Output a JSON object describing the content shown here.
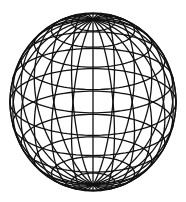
{
  "figure": {
    "type": "wireframe-sphere",
    "background": "#ffffff",
    "stroke_color": "#111111",
    "stroke_width": 1.3,
    "center": [
      93,
      102
    ],
    "radius_x": 83,
    "radius_y": 89,
    "tilt_degrees": 22,
    "latitudes_degrees": [
      -75,
      -60,
      -45,
      -30,
      -15,
      0,
      15,
      30,
      45,
      60,
      75
    ],
    "meridian_count": 12
  }
}
